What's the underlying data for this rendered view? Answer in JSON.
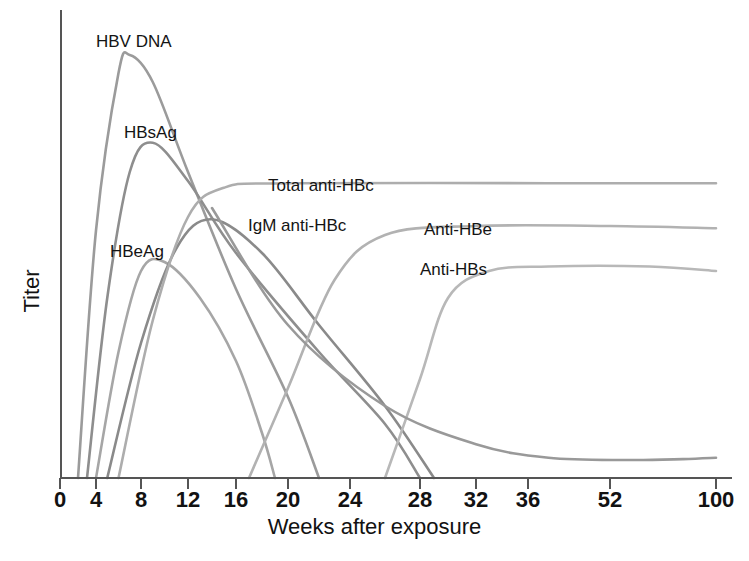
{
  "chart_data": {
    "type": "line",
    "title": "",
    "xlabel": "Weeks after exposure",
    "ylabel": "Titer",
    "xlim": [
      0,
      100
    ],
    "ylim": [
      0,
      1
    ],
    "grid": false,
    "legend_position": "inline-annotations",
    "xticks": [
      {
        "label": "0",
        "week": 0,
        "px": 60
      },
      {
        "label": "4",
        "week": 4,
        "px": 96
      },
      {
        "label": "8",
        "week": 8,
        "px": 141
      },
      {
        "label": "12",
        "week": 12,
        "px": 188
      },
      {
        "label": "16",
        "week": 16,
        "px": 236
      },
      {
        "label": "20",
        "week": 20,
        "px": 288
      },
      {
        "label": "24",
        "week": 24,
        "px": 350
      },
      {
        "label": "28",
        "week": 28,
        "px": 420
      },
      {
        "label": "32",
        "week": 32,
        "px": 476
      },
      {
        "label": "36",
        "week": 36,
        "px": 528
      },
      {
        "label": "52",
        "week": 52,
        "px": 610
      },
      {
        "label": "100",
        "week": 100,
        "px": 716
      }
    ],
    "yticks": [],
    "series": [
      {
        "name": "HBV DNA",
        "color": "#9b9b9b",
        "annotation": "HBV DNA",
        "annotation_px": {
          "x": 96,
          "y": 32
        },
        "points": [
          {
            "week": 2,
            "titer": 0.0
          },
          {
            "week": 4,
            "titer": 0.55
          },
          {
            "week": 6,
            "titer": 0.9
          },
          {
            "week": 7,
            "titer": 0.94
          },
          {
            "week": 9,
            "titer": 0.88
          },
          {
            "week": 12,
            "titer": 0.68
          },
          {
            "week": 16,
            "titer": 0.42
          },
          {
            "week": 20,
            "titer": 0.18
          },
          {
            "week": 22,
            "titer": 0.0
          }
        ]
      },
      {
        "name": "HBsAg",
        "color": "#8e8e8e",
        "annotation": "HBsAg",
        "annotation_px": {
          "x": 124,
          "y": 123
        },
        "points": [
          {
            "week": 3,
            "titer": 0.0
          },
          {
            "week": 5,
            "titer": 0.4
          },
          {
            "week": 7,
            "titer": 0.68
          },
          {
            "week": 9,
            "titer": 0.745
          },
          {
            "week": 12,
            "titer": 0.66
          },
          {
            "week": 16,
            "titer": 0.5
          },
          {
            "week": 22,
            "titer": 0.28
          },
          {
            "week": 26,
            "titer": 0.12
          },
          {
            "week": 28,
            "titer": 0.0
          }
        ]
      },
      {
        "name": "HBeAg",
        "color": "#a6a6a6",
        "annotation": "HBeAg",
        "annotation_px": {
          "x": 110,
          "y": 242
        },
        "points": [
          {
            "week": 4,
            "titer": 0.0
          },
          {
            "week": 6,
            "titer": 0.28
          },
          {
            "week": 8,
            "titer": 0.46
          },
          {
            "week": 10,
            "titer": 0.48
          },
          {
            "week": 13,
            "titer": 0.4
          },
          {
            "week": 16,
            "titer": 0.26
          },
          {
            "week": 18,
            "titer": 0.1
          },
          {
            "week": 19,
            "titer": 0.0
          }
        ]
      },
      {
        "name": "IgM anti-HBc",
        "color": "#8a8a8a",
        "annotation": "IgM anti-HBc",
        "annotation_px": {
          "x": 248,
          "y": 216
        },
        "points": [
          {
            "week": 5,
            "titer": 0.0
          },
          {
            "week": 8,
            "titer": 0.3
          },
          {
            "week": 11,
            "titer": 0.51
          },
          {
            "week": 14,
            "titer": 0.575
          },
          {
            "week": 18,
            "titer": 0.5
          },
          {
            "week": 22,
            "titer": 0.34
          },
          {
            "week": 26,
            "titer": 0.16
          },
          {
            "week": 29,
            "titer": 0.0
          }
        ]
      },
      {
        "name": "Total anti-HBc",
        "color": "#adadad",
        "annotation": "Total anti-HBc",
        "annotation_px": {
          "x": 268,
          "y": 176
        },
        "points": [
          {
            "week": 6,
            "titer": 0.0
          },
          {
            "week": 9,
            "titer": 0.35
          },
          {
            "week": 12,
            "titer": 0.58
          },
          {
            "week": 15,
            "titer": 0.645
          },
          {
            "week": 20,
            "titer": 0.655
          },
          {
            "week": 40,
            "titer": 0.655
          },
          {
            "week": 100,
            "titer": 0.655
          }
        ]
      },
      {
        "name": "Anti-HBe",
        "color": "#b2b2b2",
        "annotation": "Anti-HBe",
        "annotation_px": {
          "x": 424,
          "y": 220
        },
        "points": [
          {
            "week": 17,
            "titer": 0.0
          },
          {
            "week": 20,
            "titer": 0.2
          },
          {
            "week": 23,
            "titer": 0.44
          },
          {
            "week": 26,
            "titer": 0.54
          },
          {
            "week": 32,
            "titer": 0.56
          },
          {
            "week": 52,
            "titer": 0.56
          },
          {
            "week": 100,
            "titer": 0.555
          }
        ]
      },
      {
        "name": "Anti-HBs",
        "color": "#b8b8b8",
        "annotation": "Anti-HBs",
        "annotation_px": {
          "x": 420,
          "y": 260
        },
        "points": [
          {
            "week": 26,
            "titer": 0.0
          },
          {
            "week": 28,
            "titer": 0.22
          },
          {
            "week": 30,
            "titer": 0.4
          },
          {
            "week": 33,
            "titer": 0.46
          },
          {
            "week": 40,
            "titer": 0.47
          },
          {
            "week": 70,
            "titer": 0.47
          },
          {
            "week": 100,
            "titer": 0.46
          }
        ]
      },
      {
        "name": "HBV DNA tail",
        "color": "#999999",
        "annotation": "",
        "annotation_px": {
          "x": 0,
          "y": 0
        },
        "points": [
          {
            "week": 14,
            "titer": 0.6
          },
          {
            "week": 20,
            "titer": 0.34
          },
          {
            "week": 26,
            "titer": 0.16
          },
          {
            "week": 32,
            "titer": 0.075
          },
          {
            "week": 40,
            "titer": 0.045
          },
          {
            "week": 60,
            "titer": 0.04
          },
          {
            "week": 85,
            "titer": 0.042
          },
          {
            "week": 100,
            "titer": 0.045
          }
        ]
      }
    ]
  },
  "annotations": {
    "hbv_dna": "HBV DNA",
    "hbsag": "HBsAg",
    "hbeag": "HBeAg",
    "igm_anti_hbc": "IgM anti-HBc",
    "total_anti_hbc": "Total anti-HBc",
    "anti_hbe": "Anti-HBe",
    "anti_hbs": "Anti-HBs"
  },
  "axes": {
    "x_title": "Weeks after exposure",
    "y_title": "Titer",
    "axis_color": "#555555"
  }
}
